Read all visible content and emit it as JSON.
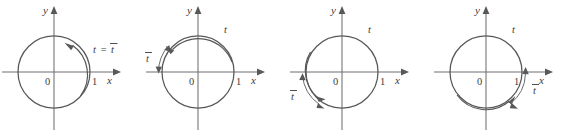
{
  "figure": {
    "background_color": "#ffffff",
    "line_color": "#58585b",
    "axis_color": "#6f6f72",
    "text_color": "#3b3b3d",
    "panel_count": 4
  },
  "common": {
    "x_axis_label": "x",
    "y_axis_label": "y",
    "origin_label": "0",
    "unit_label": "1",
    "t_label": "t",
    "t_bar_label": "t",
    "t_bar_overbar": "̅",
    "equals_label": "="
  },
  "panels": [
    {
      "id": "panel-1",
      "name": "circle-t-equals-tbar",
      "x_axis_label": "x",
      "y_axis_label": "y",
      "origin_label": "0",
      "unit_label": "1",
      "annotation": "t = t̅",
      "annotation_parts": {
        "lhs": "t",
        "op": "=",
        "rhs": "t"
      },
      "arrow_direction": "counterclockwise",
      "arrow_angle_deg": 68,
      "arc_label": null
    },
    {
      "id": "panel-2",
      "name": "circle-tbar-second-quadrant",
      "x_axis_label": "x",
      "y_axis_label": "y",
      "origin_label": "0",
      "unit_label": "1",
      "annotation": "t",
      "arc_label": "t̅",
      "arrow_direction": "counterclockwise",
      "arrow_angle_deg": 140,
      "arc_start_deg": 180,
      "arc_end_deg": 140
    },
    {
      "id": "panel-3",
      "name": "circle-tbar-third-quadrant",
      "x_axis_label": "x",
      "y_axis_label": "y",
      "origin_label": "0",
      "unit_label": "1",
      "annotation": "t",
      "arc_label": "t̅",
      "arrow_direction": "clockwise",
      "arrow_angle_deg": 228,
      "arc_start_deg": 180,
      "arc_end_deg": 230
    },
    {
      "id": "panel-4",
      "name": "circle-tbar-fourth-quadrant",
      "x_axis_label": "x",
      "y_axis_label": "y",
      "origin_label": "0",
      "unit_label": "1",
      "annotation": "t",
      "arc_label": "t̅",
      "arrow_direction": "clockwise",
      "arrow_angle_deg": 295,
      "arc_start_deg": 360,
      "arc_end_deg": 300
    }
  ]
}
